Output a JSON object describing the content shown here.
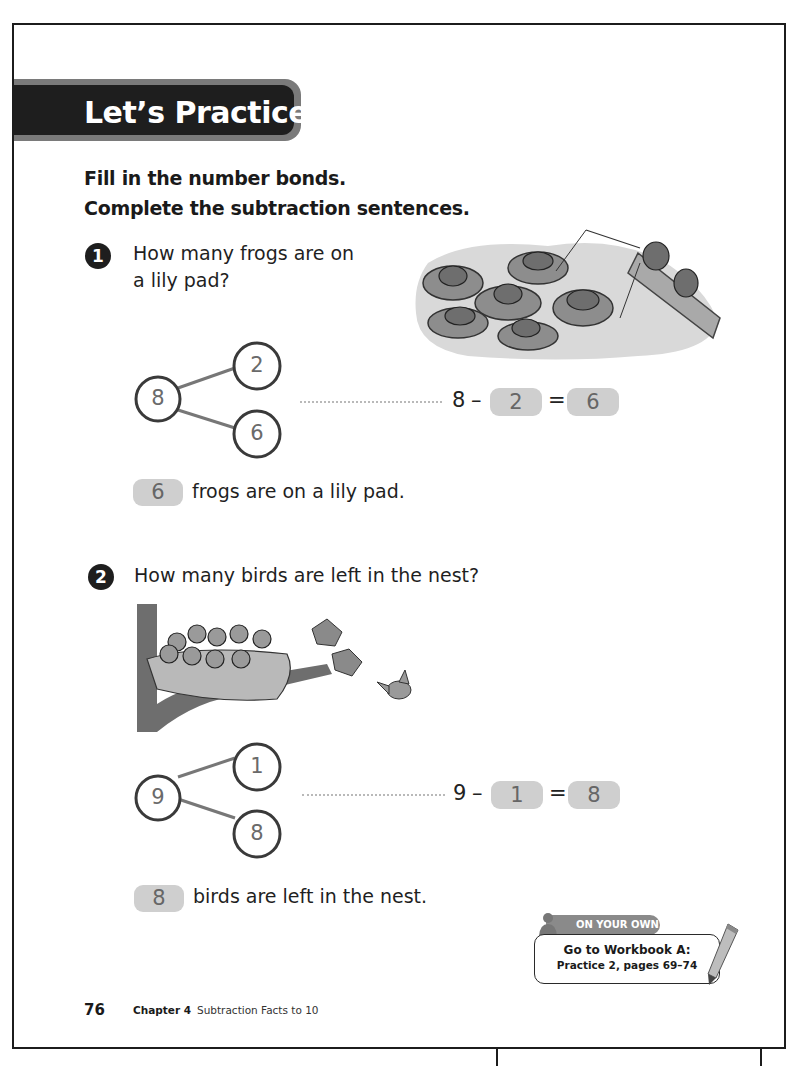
{
  "banner": {
    "title": "Let’s Practice"
  },
  "instructions": {
    "line1": "Fill in the number bonds.",
    "line2": "Complete the subtraction sentences."
  },
  "questions": [
    {
      "number": "1",
      "prompt_line1": "How many frogs are on",
      "prompt_line2": "a lily pad?",
      "illustration": "frogs-on-lily-pads-illustration",
      "bond": {
        "whole": "8",
        "part1": "2",
        "part2": "6"
      },
      "equation": {
        "minuend": "8",
        "minus": "–",
        "subtrahend": "2",
        "equals": "=",
        "difference": "6"
      },
      "answer": {
        "value": "6",
        "text": "frogs are on a lily pad."
      }
    },
    {
      "number": "2",
      "prompt_line1": "How many birds are left in the nest?",
      "illustration": "birds-in-nest-illustration",
      "bond": {
        "whole": "9",
        "part1": "1",
        "part2": "8"
      },
      "equation": {
        "minuend": "9",
        "minus": "–",
        "subtrahend": "1",
        "equals": "=",
        "difference": "8"
      },
      "answer": {
        "value": "8",
        "text": "birds are left in the nest."
      }
    }
  ],
  "on_your_own": {
    "tab_label": "ON YOUR OWN",
    "line1": "Go to Workbook A:",
    "line2": "Practice 2, pages 69–74"
  },
  "footer": {
    "page_number": "76",
    "chapter_label": "Chapter 4",
    "chapter_title": "Subtraction Facts to 10"
  },
  "colors": {
    "banner_dark": "#1e1e1e",
    "banner_edge": "#7a7a7a",
    "answer_box": "#cfcfcf",
    "answer_text": "#666666"
  }
}
